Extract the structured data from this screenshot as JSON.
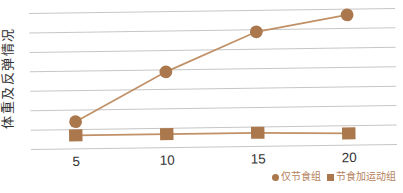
{
  "chart_data": {
    "type": "line",
    "title": "",
    "xlabel": "",
    "ylabel": "体重及反弹情况",
    "x": [
      5,
      10,
      15,
      20
    ],
    "x_tick_labels": [
      "5",
      "10",
      "15",
      "20"
    ],
    "series": [
      {
        "name": "仅节食组",
        "marker": "circle",
        "values": [
          1.4,
          3.9,
          5.9,
          6.7
        ]
      },
      {
        "name": "节食加运动组",
        "marker": "square",
        "values": [
          0.7,
          0.7,
          0.7,
          0.6
        ]
      }
    ],
    "ylim": [
      0,
      7
    ],
    "y_gridline_values": [
      0,
      1,
      2,
      3,
      4,
      5,
      6,
      7
    ],
    "y_axis_numeric_labels_shown": false,
    "grid": "horizontal-only",
    "legend_position": "bottom-right",
    "colors": {
      "marker": "#ab774c",
      "line": "#c09066",
      "gridline": "#c6c6c6",
      "axis_text": "#333333",
      "legend_text": "#b5825c",
      "background": "#ffffff"
    }
  }
}
